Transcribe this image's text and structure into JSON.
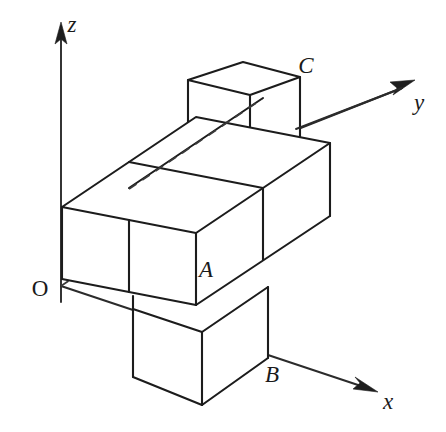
{
  "figure": {
    "background_color": "#ffffff",
    "edge_color": "#1c1c1c",
    "hidden_edge_color": "#3a3a3a",
    "axis_color": "#2b2b2b"
  },
  "axes": {
    "origin": {
      "label": "O",
      "x": 40,
      "y": 296
    },
    "x_axis": {
      "label": "x",
      "label_x": 388,
      "label_y": 409,
      "arrow_tip_x": 376,
      "arrow_tip_y": 391
    },
    "y_axis": {
      "label": "y",
      "label_x": 419,
      "label_y": 110,
      "arrow_tip_x": 413,
      "arrow_tip_y": 82
    },
    "z_axis": {
      "label": "z",
      "label_x": 72,
      "label_y": 32,
      "arrow_tip_x": 61,
      "arrow_tip_y": 24
    }
  },
  "points": [
    {
      "name": "A",
      "label": "A",
      "label_x": 206,
      "label_y": 277,
      "vertex_x": 203,
      "vertex_y": 254
    },
    {
      "name": "B",
      "label": "B",
      "label_x": 272,
      "label_y": 382,
      "vertex_x": 265,
      "vertex_y": 358
    },
    {
      "name": "C",
      "label": "C",
      "label_x": 306,
      "label_y": 73,
      "vertex_x": 300,
      "vertex_y": 77
    }
  ],
  "projection": {
    "origin_px": [
      61,
      286
    ],
    "unit_x_px": [
      71,
      24
    ],
    "unit_y_px": [
      67,
      -45
    ],
    "unit_z_px": [
      0,
      -73
    ]
  },
  "solid": {
    "description": "2 by 2 by 1 slab with one unit cube below the front-left column and one unit cube on top of the back-right column",
    "cube_count": 6
  }
}
